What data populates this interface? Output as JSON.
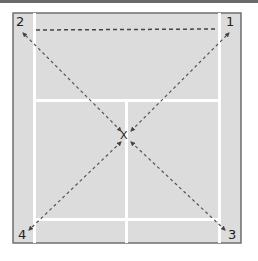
{
  "diagram": {
    "type": "badminton-court-footwork",
    "colors": {
      "court_fill": "#dcdcdc",
      "court_border": "#6e6e6e",
      "court_lines": "#ffffff",
      "arrows": "#444444",
      "top_bar": "#6a6a6a"
    },
    "center_marker": "X",
    "corners": [
      {
        "id": "1",
        "label": "1",
        "position": "top-right"
      },
      {
        "id": "2",
        "label": "2",
        "position": "top-left"
      },
      {
        "id": "3",
        "label": "3",
        "position": "bottom-right"
      },
      {
        "id": "4",
        "label": "4",
        "position": "bottom-left"
      }
    ],
    "arrows": [
      {
        "from": "center",
        "to": "1",
        "style": "dashed",
        "bidirectional": true
      },
      {
        "from": "center",
        "to": "2",
        "style": "dashed",
        "bidirectional": true
      },
      {
        "from": "center",
        "to": "3",
        "style": "dashed",
        "bidirectional": true
      },
      {
        "from": "center",
        "to": "4",
        "style": "dashed",
        "bidirectional": true
      }
    ],
    "net_line": {
      "style": "dashed",
      "position": "top"
    }
  }
}
